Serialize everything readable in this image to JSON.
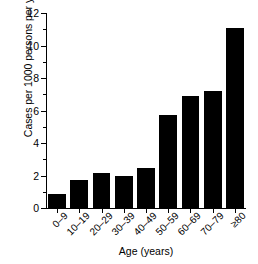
{
  "chart_data": {
    "type": "bar",
    "title": "",
    "xlabel": "Age (years)",
    "ylabel": "Cases per 1000 persons per year",
    "categories": [
      "0–9",
      "10–19",
      "20–29",
      "30–39",
      "40–49",
      "50–59",
      "60–69",
      "70–79",
      "≥80"
    ],
    "values": [
      0.85,
      1.7,
      2.15,
      2.0,
      2.45,
      5.7,
      6.9,
      7.2,
      11.1
    ],
    "ylim": [
      0,
      12
    ],
    "yticks": [
      0,
      2,
      4,
      6,
      8,
      10,
      12
    ],
    "ytick_labels": [
      "0",
      "2",
      "4",
      "6",
      "8",
      "10",
      "12"
    ],
    "yminor_ticks": [
      1,
      3,
      5,
      7,
      9,
      11
    ],
    "grid": false,
    "legend": false,
    "legend_position": "none",
    "bar_color": "#000000",
    "axis_color": "#000000",
    "background_color": "#ffffff"
  }
}
